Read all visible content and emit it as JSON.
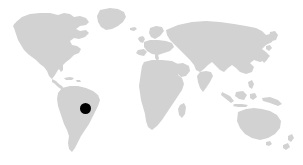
{
  "figure": {
    "kind": "world-map-with-location-marker",
    "width": 303,
    "height": 165,
    "background_color": "#ffffff",
    "title": "",
    "caption": "",
    "labels_visible": false,
    "graticule_visible": false,
    "border_visible": false,
    "legend_visible": false
  },
  "map": {
    "projection_style": "equirectangular",
    "land_color": "#d2d2d2",
    "ocean_color": "#ffffff",
    "land_stroke": "none",
    "continents_visible": [
      "North America",
      "Greenland",
      "South America",
      "Europe",
      "Africa",
      "Madagascar",
      "Asia",
      "Southeast Asia / Indonesia",
      "Australia",
      "New Zealand",
      "Japan",
      "British Isles"
    ]
  },
  "markers": [
    {
      "name": "location-marker",
      "shape": "filled-circle",
      "color": "#000000",
      "center_x": 85.5,
      "center_y": 108.5,
      "diameter": 11,
      "radius": 5.5,
      "region": "Brazil",
      "continent": "South America",
      "label": ""
    }
  ],
  "annotations": [],
  "colors": {
    "land": "#d2d2d2",
    "marker": "#000000",
    "background": "#ffffff"
  }
}
